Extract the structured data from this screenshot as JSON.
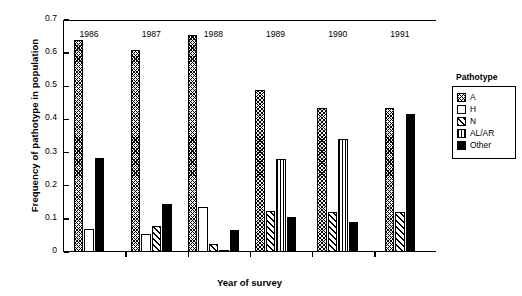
{
  "chart_data": {
    "type": "bar",
    "title": "",
    "xlabel": "Year of survey",
    "ylabel": "Frequency of pathotype in population",
    "categories": [
      "1986",
      "1987",
      "1988",
      "1989",
      "1990",
      "1991"
    ],
    "ylim": [
      0,
      0.7
    ],
    "yticks": [
      "0",
      "0.1",
      "0.2",
      "0.3",
      "0.4",
      "0.5",
      "0.6",
      "0.7"
    ],
    "ytick_values": [
      0,
      0.1,
      0.2,
      0.3,
      0.4,
      0.5,
      0.6,
      0.7
    ],
    "grid": false,
    "legend_position": "right",
    "legend_title": "Pathotype",
    "series": [
      {
        "name": "A",
        "pattern": "dense-cross-hatch",
        "values": [
          0.64,
          0.61,
          0.655,
          0.49,
          0.435,
          0.435
        ]
      },
      {
        "name": "H",
        "pattern": "white",
        "values": [
          0.07,
          0.055,
          0.135,
          0,
          0,
          0
        ]
      },
      {
        "name": "N",
        "pattern": "diagonal-hatch",
        "values": [
          0,
          0.08,
          0.025,
          0.125,
          0.12,
          0.12
        ]
      },
      {
        "name": "AL/AR",
        "pattern": "vertical-stripes",
        "values": [
          0,
          0,
          0.005,
          0.28,
          0.34,
          0
        ]
      },
      {
        "name": "Other",
        "pattern": "solid-black",
        "values": [
          0.285,
          0.145,
          0.065,
          0.105,
          0.09,
          0.415
        ]
      }
    ]
  },
  "legend": {
    "title": "Pathotype",
    "items": [
      {
        "label": "A"
      },
      {
        "label": "H"
      },
      {
        "label": "N"
      },
      {
        "label": "AL/AR"
      },
      {
        "label": "Other"
      }
    ]
  },
  "axes": {
    "y_title": "Frequency of pathotype in population",
    "x_title": "Year of survey"
  }
}
